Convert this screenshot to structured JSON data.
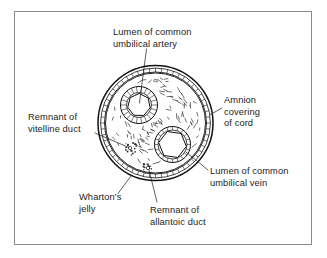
{
  "figure": {
    "domain": "anatomical-diagram",
    "frame": {
      "x": 14,
      "y": 11,
      "width": 298,
      "height": 234,
      "border_color": "#8a8a8a",
      "background": "#ffffff"
    },
    "ink_color": "#111111",
    "text_color": "#1c1c1c"
  },
  "cord": {
    "center": {
      "x": 155.5,
      "y": 123.0
    },
    "amnion_outer_radius": 57.5,
    "amnion_inner_radius": 51.0,
    "amnion_mid_radius": 54.5,
    "amnion_tick_count": 56,
    "jelly_radius": 50.0,
    "jelly_dash_count": 96,
    "jelly_dash_seed": 7
  },
  "vessels": [
    {
      "id": "umbilical-artery-upper",
      "name": "common umbilical artery",
      "center": {
        "x": 139.0,
        "y": 105.0
      },
      "wall_outer_radius": 18.5,
      "wall_inner_radius": 12.5,
      "wall_tick_count": 22,
      "lumen_sides": 7,
      "lumen_radius": 11.5,
      "lumen_rotation": 14
    },
    {
      "id": "umbilical-vein",
      "name": "common umbilical vein",
      "center": {
        "x": 172.5,
        "y": 144.5
      },
      "wall_outer_radius": 18.0,
      "wall_inner_radius": 14.5,
      "wall_tick_count": 20,
      "lumen_sides": 6,
      "lumen_radius": 14.0,
      "lumen_rotation": 8
    }
  ],
  "remnants": [
    {
      "id": "vitelline-duct-remnant",
      "name": "remnant of vitelline duct",
      "center": {
        "x": 130.0,
        "y": 148.0
      },
      "radius": 7.5,
      "dot_count": 16,
      "seed": 3
    },
    {
      "id": "allantoic-duct-remnant",
      "name": "remnant of allantoic duct",
      "center": {
        "x": 148.0,
        "y": 168.0
      },
      "radius": 6.0,
      "dot_count": 12,
      "seed": 11
    }
  ],
  "labels": [
    {
      "id": "lumen-common-umbilical-artery",
      "lines": [
        "Lumen of common",
        "umbilical artery"
      ],
      "text_x": 113,
      "text_y": 35,
      "anchor": "start",
      "leader": [
        {
          "x": 146.5,
          "y": 49.0
        },
        {
          "x": 139.5,
          "y": 103.0
        }
      ]
    },
    {
      "id": "amnion-covering-of-cord",
      "lines": [
        "Amnion",
        "covering",
        "of cord"
      ],
      "text_x": 224,
      "text_y": 103,
      "anchor": "start",
      "leader": [
        {
          "x": 222.0,
          "y": 108.0
        },
        {
          "x": 210.5,
          "y": 114.5
        }
      ]
    },
    {
      "id": "remnant-of-vitelline-duct",
      "lines": [
        "Remnant of",
        "vitelline duct"
      ],
      "text_x": 28,
      "text_y": 120,
      "anchor": "start",
      "leader": [
        {
          "x": 95.0,
          "y": 133.0
        },
        {
          "x": 129.0,
          "y": 147.5
        }
      ]
    },
    {
      "id": "lumen-common-umbilical-vein",
      "lines": [
        "Lumen of common",
        "umbilical vein"
      ],
      "text_x": 210,
      "text_y": 174,
      "anchor": "start",
      "leader": [
        {
          "x": 208.0,
          "y": 170.0
        },
        {
          "x": 186.0,
          "y": 152.0
        }
      ]
    },
    {
      "id": "whartons-jelly",
      "lines": [
        "Wharton's",
        "jelly"
      ],
      "text_x": 79,
      "text_y": 200,
      "anchor": "start",
      "leader": [
        {
          "x": 118.0,
          "y": 193.5
        },
        {
          "x": 131.0,
          "y": 176.0
        }
      ]
    },
    {
      "id": "remnant-of-allantoic-duct",
      "lines": [
        "Remnant of",
        "allantoic duct"
      ],
      "text_x": 150,
      "text_y": 213,
      "anchor": "start",
      "leader": [
        {
          "x": 157.0,
          "y": 202.0
        },
        {
          "x": 149.0,
          "y": 170.0
        }
      ]
    }
  ]
}
